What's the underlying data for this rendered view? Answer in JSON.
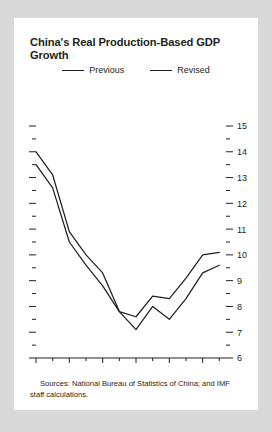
{
  "chart_data": {
    "type": "line",
    "title": "China's Real Production-Based GDP Growth",
    "xlabel": "",
    "ylabel": "",
    "x": [
      1993,
      1994,
      1995,
      1996,
      1997,
      1998,
      1999,
      2000,
      2001,
      2002,
      2003,
      2004
    ],
    "xlim": [
      1993,
      2004.4
    ],
    "ylim": [
      6,
      15
    ],
    "yticks_major": [
      6,
      7,
      8,
      9,
      10,
      11,
      12,
      13,
      14,
      15
    ],
    "yticks_minor": [
      6.5,
      7.5,
      8.5,
      9.5,
      10.5,
      11.5,
      12.5,
      13.5,
      14.5
    ],
    "ytick_labels": [
      "6",
      "7",
      "8",
      "9",
      "10",
      "11",
      "12",
      "13",
      "14",
      "15"
    ],
    "xticks_major": [
      1993,
      1995,
      1997,
      1999,
      2001,
      2003
    ],
    "xticks_minor": [
      1994,
      1996,
      1998,
      2000,
      2002,
      2004
    ],
    "xtick_labels": [
      "1993",
      "95",
      "97",
      "99",
      "2001",
      "03"
    ],
    "grid": false,
    "legend_position": "top-center",
    "axis_labels_side": "right",
    "series": [
      {
        "name": "Previous",
        "color": "#231f20",
        "values": [
          13.5,
          12.6,
          10.5,
          9.6,
          8.8,
          7.8,
          7.1,
          8.0,
          7.5,
          8.3,
          9.3,
          9.6
        ]
      },
      {
        "name": "Revised",
        "color": "#231f20",
        "values": [
          14.0,
          13.1,
          10.9,
          10.0,
          9.3,
          7.8,
          7.6,
          8.4,
          8.3,
          9.1,
          10.0,
          10.1
        ]
      }
    ]
  },
  "legend": {
    "items": [
      {
        "label": "Previous"
      },
      {
        "label": "Revised"
      }
    ]
  },
  "source": {
    "text": "Sources: National Bureau of Statistics of China; and IMF staff calculations."
  }
}
